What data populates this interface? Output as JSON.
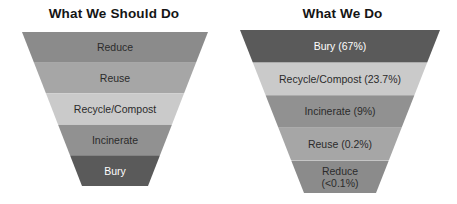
{
  "chart_data": {
    "type": "bar",
    "xlabel": "",
    "ylabel": "",
    "panels": [
      {
        "title": "What We Should Do",
        "categories": [
          "Reduce",
          "Reuse",
          "Recycle/Compost",
          "Incinerate",
          "Bury"
        ],
        "values": [
          20,
          20,
          20,
          20,
          20
        ],
        "labels": [
          "Reduce",
          "Reuse",
          "Recycle/Compost",
          "Incinerate",
          "Bury"
        ],
        "colors": [
          "#8b8b8b",
          "#a6a6a6",
          "#cacaca",
          "#919191",
          "#5a5a5a"
        ]
      },
      {
        "title": "What We Do",
        "categories": [
          "Bury",
          "Recycle/Compost",
          "Incinerate",
          "Reuse",
          "Reduce"
        ],
        "values": [
          67,
          23.7,
          9,
          0.2,
          0.05
        ],
        "labels": [
          "Bury (67%)",
          "Recycle/Compost (23.7%)",
          "Incinerate (9%)",
          "Reuse (0.2%)",
          "Reduce\n(<0.1%)"
        ],
        "colors": [
          "#5a5a5a",
          "#cacaca",
          "#919191",
          "#a6a6a6",
          "#8b8b8b"
        ]
      }
    ]
  },
  "left": {
    "title": "What We Should Do",
    "bands": [
      {
        "label": "Reduce"
      },
      {
        "label": "Reuse"
      },
      {
        "label": "Recycle/Compost"
      },
      {
        "label": "Incinerate"
      },
      {
        "label": "Bury"
      }
    ]
  },
  "right": {
    "title": "What We Do",
    "bands": [
      {
        "label": "Bury (67%)"
      },
      {
        "label": "Recycle/Compost (23.7%)"
      },
      {
        "label": "Incinerate (9%)"
      },
      {
        "label": "Reuse (0.2%)"
      },
      {
        "label": "Reduce\n(<0.1%)"
      }
    ]
  },
  "colors": {
    "band_reduce": "#8b8b8b",
    "band_reuse": "#a6a6a6",
    "band_recycle": "#cacaca",
    "band_incinerate": "#919191",
    "band_bury": "#5a5a5a",
    "background": "#ffffff",
    "title_text": "#151515",
    "label_text": "#2b2b2b",
    "label_text_light": "#ffffff"
  }
}
